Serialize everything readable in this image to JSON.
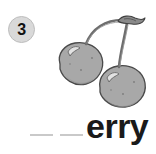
{
  "page": {
    "background_color": "#ffffff",
    "width": 156,
    "height": 154
  },
  "badge": {
    "number": "3",
    "fill_color": "#d9d9d9",
    "text_color": "#111111",
    "icon_name": "circle-badge"
  },
  "illustration": {
    "name": "cherries-illustration",
    "subject": "cherries",
    "style": "grayscale line drawing",
    "fill_color": "#a8a8a8",
    "outline_color": "#4a4a4a",
    "shade_color": "#8e8e8e",
    "highlight_color": "#d6d6d6",
    "stem_color": "#7a7a7a",
    "parts": [
      "left-cherry",
      "right-cherry",
      "left-stem",
      "right-stem",
      "stem-knot"
    ]
  },
  "word_prompt": {
    "blanks": [
      "blank-1",
      "blank-2"
    ],
    "blank_count": 2,
    "blank_color": "#c9c9c9",
    "suffix": "erry",
    "suffix_color": "#1a1a1a"
  }
}
